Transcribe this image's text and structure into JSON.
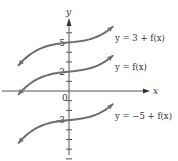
{
  "diagram": {
    "title": "",
    "axes": {
      "x_label": "x",
      "y_label": "y",
      "origin_label": "0",
      "x_range": [
        -7,
        7
      ],
      "y_range": [
        -7,
        7
      ],
      "y_ticks": [
        -7,
        -6,
        -5,
        -4,
        -3,
        -2,
        -1,
        1,
        2,
        3,
        4,
        5,
        6
      ],
      "labeled_ticks": [
        {
          "value": 5,
          "label": "5"
        },
        {
          "value": 2,
          "label": "2"
        },
        {
          "value": -3,
          "label": "-3"
        }
      ]
    },
    "curves": [
      {
        "id": "shift-up",
        "label": "y = 3 + f(x)",
        "vertical_shift": 3,
        "y_intercept": 5
      },
      {
        "id": "base",
        "label": "y = f(x)",
        "vertical_shift": 0,
        "y_intercept": 2
      },
      {
        "id": "shift-down",
        "label": "y = −5 + f(x)",
        "vertical_shift": -5,
        "y_intercept": -3
      }
    ],
    "colors": {
      "curve": "#6e6e6e",
      "axis": "#555555",
      "text": "#333333"
    }
  }
}
